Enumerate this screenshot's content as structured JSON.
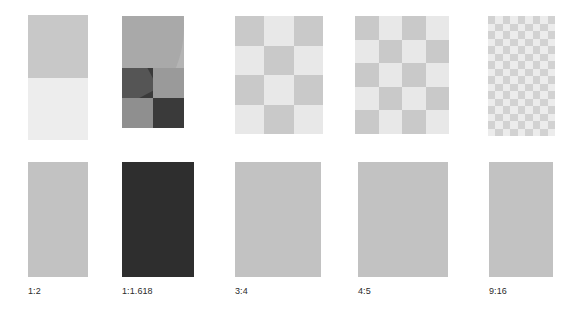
{
  "page": {
    "background": "#ffffff",
    "width": 566,
    "height": 309
  },
  "palette": {
    "light_gray": "#e8e8e8",
    "mid_gray": "#c9c9c9",
    "solid_gray": "#c2c2c2",
    "dark": "#3a3a3a",
    "very_light": "#ededed",
    "label_color": "#2b2b2b"
  },
  "columns": [
    {
      "id": "ratio-1-2",
      "label": "1:2",
      "ratio_w": 1,
      "ratio_h": 2,
      "pattern": "half-split",
      "demo": {
        "x": 28,
        "y": 15,
        "w": 60,
        "h": 125
      },
      "solid": {
        "x": 28,
        "y": 162,
        "w": 60,
        "h": 115,
        "color": "#c2c2c2"
      },
      "label_pos": {
        "x": 28,
        "y": 286
      },
      "cells_x": 1,
      "cells_y": 2
    },
    {
      "id": "ratio-1-1618",
      "label": "1:1.618",
      "ratio_w": 1,
      "ratio_h": 1.618,
      "pattern": "golden-spiral",
      "demo": {
        "x": 122,
        "y": 16,
        "w": 62,
        "h": 112
      },
      "solid": {
        "x": 122,
        "y": 162,
        "w": 72,
        "h": 115,
        "color": "#2e2e2e"
      },
      "label_pos": {
        "x": 122,
        "y": 286
      },
      "cells_x": 2,
      "cells_y": 3
    },
    {
      "id": "ratio-3-4",
      "label": "3:4",
      "ratio_w": 3,
      "ratio_h": 4,
      "pattern": "checkerboard",
      "demo": {
        "x": 235,
        "y": 16,
        "w": 88,
        "h": 118
      },
      "solid": {
        "x": 235,
        "y": 162,
        "w": 86,
        "h": 115,
        "color": "#c2c2c2"
      },
      "label_pos": {
        "x": 235,
        "y": 286
      },
      "cells_x": 3,
      "cells_y": 4
    },
    {
      "id": "ratio-4-5",
      "label": "4:5",
      "ratio_w": 4,
      "ratio_h": 5,
      "pattern": "checkerboard",
      "demo": {
        "x": 355,
        "y": 16,
        "w": 94,
        "h": 118
      },
      "solid": {
        "x": 358,
        "y": 162,
        "w": 90,
        "h": 115,
        "color": "#c2c2c2"
      },
      "label_pos": {
        "x": 358,
        "y": 286
      },
      "cells_x": 4,
      "cells_y": 5
    },
    {
      "id": "ratio-9-16",
      "label": "9:16",
      "ratio_w": 9,
      "ratio_h": 16,
      "pattern": "checkerboard-fine",
      "demo": {
        "x": 488,
        "y": 16,
        "w": 67,
        "h": 120
      },
      "solid": {
        "x": 489,
        "y": 162,
        "w": 64,
        "h": 115,
        "color": "#c2c2c2"
      },
      "label_pos": {
        "x": 489,
        "y": 286
      },
      "cells_x": 9,
      "cells_y": 16
    }
  ]
}
